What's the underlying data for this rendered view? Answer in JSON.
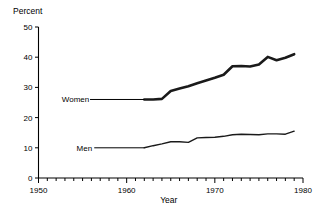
{
  "chart_data": {
    "type": "line",
    "title": "",
    "xlabel": "Year",
    "ylabel": "Percent",
    "xlim": [
      1950,
      1980
    ],
    "ylim": [
      0,
      50
    ],
    "grid": false,
    "legend_position": "inline-labels",
    "x_ticks_major": [
      1950,
      1960,
      1970,
      1980
    ],
    "x_tick_labels": [
      "1950",
      "1960",
      "1970",
      "1980"
    ],
    "x_minor_tick_interval": 1,
    "y_ticks": [
      0,
      10,
      20,
      30,
      40,
      50
    ],
    "y_tick_labels": [
      "0",
      "10",
      "20",
      "30",
      "40",
      "50"
    ],
    "series": [
      {
        "name": "Women",
        "label": "Women",
        "color": "#1a1a1a",
        "line_width": 2.6,
        "x": [
          1962,
          1963,
          1964,
          1965,
          1966,
          1967,
          1968,
          1969,
          1970,
          1971,
          1972,
          1973,
          1974,
          1975,
          1976,
          1977,
          1978,
          1979
        ],
        "values": [
          26.0,
          26.0,
          26.2,
          28.8,
          29.6,
          30.4,
          31.4,
          32.3,
          33.2,
          34.2,
          37.0,
          37.1,
          36.9,
          37.6,
          40.1,
          39.0,
          39.8,
          41.0
        ]
      },
      {
        "name": "Men",
        "label": "Men",
        "color": "#1a1a1a",
        "line_width": 1.4,
        "x": [
          1962,
          1963,
          1964,
          1965,
          1966,
          1967,
          1968,
          1969,
          1970,
          1971,
          1972,
          1973,
          1974,
          1975,
          1976,
          1977,
          1978,
          1979
        ],
        "values": [
          10.0,
          10.7,
          11.3,
          12.0,
          12.0,
          11.8,
          13.3,
          13.4,
          13.5,
          13.8,
          14.3,
          14.5,
          14.4,
          14.3,
          14.6,
          14.6,
          14.5,
          15.5
        ]
      }
    ],
    "annotations": [
      {
        "name": "women-label",
        "text": "Women",
        "anchor_x": 1962,
        "anchor_y": 26.0,
        "label_x": 1954.2,
        "label_y": 26.0
      },
      {
        "name": "men-label",
        "text": "Men",
        "anchor_x": 1962,
        "anchor_y": 10.0,
        "label_x": 1955.2,
        "label_y": 10.0
      }
    ]
  }
}
